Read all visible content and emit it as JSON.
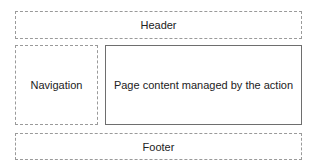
{
  "layout": {
    "header": {
      "label": "Header"
    },
    "navigation": {
      "label": "Navigation"
    },
    "content": {
      "label": "Page content managed by the action"
    },
    "footer": {
      "label": "Footer"
    }
  }
}
